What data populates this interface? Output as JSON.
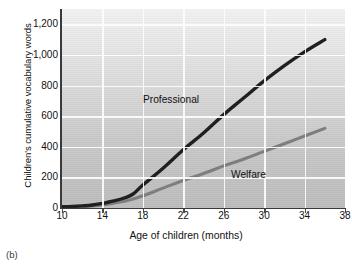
{
  "panel": {
    "caption": "(b)"
  },
  "chart_data": {
    "type": "line",
    "title": "",
    "xlabel": "Age of children (months)",
    "ylabel": "Children's cumulative vocabulary words",
    "xlim": [
      10,
      38
    ],
    "ylim": [
      0,
      1300
    ],
    "xticks": [
      "10",
      "14",
      "18",
      "22",
      "26",
      "30",
      "34",
      "38"
    ],
    "xtick_values": [
      10,
      14,
      18,
      22,
      26,
      30,
      34,
      38
    ],
    "yticks": [
      "0",
      "200",
      "400",
      "600",
      "800",
      "1,000",
      "1,200"
    ],
    "ytick_values": [
      0,
      200,
      400,
      600,
      800,
      1000,
      1200
    ],
    "grid": true,
    "legend": "inline-labels",
    "series": [
      {
        "name": "Professional",
        "color": "#1c1c1c",
        "label_text": "Professional",
        "x": [
          10,
          11,
          12,
          13,
          14,
          15,
          16,
          17,
          18,
          20,
          22,
          24,
          26,
          28,
          30,
          32,
          34,
          36
        ],
        "values": [
          8,
          10,
          14,
          20,
          30,
          45,
          62,
          90,
          150,
          260,
          380,
          490,
          610,
          720,
          830,
          930,
          1020,
          1100
        ]
      },
      {
        "name": "Welfare",
        "color": "#7d7d7d",
        "label_text": "Welfare",
        "x": [
          10,
          11,
          12,
          13,
          14,
          15,
          16,
          17,
          18,
          20,
          22,
          24,
          26,
          28,
          30,
          32,
          34,
          36
        ],
        "values": [
          5,
          7,
          10,
          14,
          20,
          30,
          42,
          58,
          80,
          130,
          180,
          225,
          275,
          320,
          370,
          420,
          470,
          520
        ]
      }
    ]
  }
}
